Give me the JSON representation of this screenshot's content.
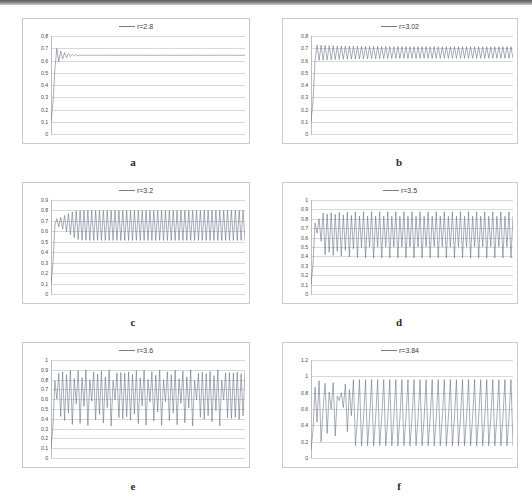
{
  "figure": {
    "accent_color": "#5f6b80",
    "gridline_color": "#d8d8d8",
    "panel_border_color": "#c9c9c9"
  },
  "panels": [
    {
      "caption": "a",
      "legend": "r=2.8",
      "legend_marker": "line-marker",
      "chart_data": {
        "type": "line",
        "title": "r=2.8",
        "xlabel": "",
        "ylabel": "",
        "legend": [
          "r=2.8"
        ],
        "legend_position": "top-center",
        "grid": true,
        "ylim": [
          0,
          0.8
        ],
        "yticks": [
          0,
          0.1,
          0.2,
          0.3,
          0.4,
          0.5,
          0.6,
          0.7,
          0.8
        ],
        "ytick_labels": [
          "0",
          "0.1",
          "0.2",
          "0.3",
          "0.4",
          "0.5",
          "0.6",
          "0.7",
          "0.8"
        ],
        "xlim": [
          0,
          100
        ],
        "r": 2.8,
        "x0": 0.1,
        "behavior": "damped oscillation converging to fixed point 0.643",
        "fixed_point": 0.643
      }
    },
    {
      "caption": "b",
      "legend": "r=3.02",
      "legend_marker": "line-marker",
      "chart_data": {
        "type": "line",
        "title": "r=3.02",
        "xlabel": "",
        "ylabel": "",
        "legend": [
          "r=3.02"
        ],
        "legend_position": "top-center",
        "grid": true,
        "ylim": [
          0,
          0.8
        ],
        "yticks": [
          0,
          0.1,
          0.2,
          0.3,
          0.4,
          0.5,
          0.6,
          0.7,
          0.8
        ],
        "ytick_labels": [
          "0",
          "0.1",
          "0.2",
          "0.3",
          "0.4",
          "0.5",
          "0.6",
          "0.7",
          "0.8"
        ],
        "xlim": [
          0,
          100
        ],
        "r": 3.02,
        "x0": 0.1,
        "behavior": "period-2 cycle between about 0.62 and 0.71",
        "cycle": [
          0.62,
          0.71
        ]
      }
    },
    {
      "caption": "c",
      "legend": "r=3.2",
      "legend_marker": "line-marker",
      "chart_data": {
        "type": "line",
        "title": "r=3.2",
        "xlabel": "",
        "ylabel": "",
        "legend": [
          "r=3.2"
        ],
        "legend_position": "top-center",
        "grid": true,
        "ylim": [
          0,
          0.9
        ],
        "yticks": [
          0,
          0.1,
          0.2,
          0.3,
          0.4,
          0.5,
          0.6,
          0.7,
          0.8,
          0.9
        ],
        "ytick_labels": [
          "0",
          "0.1",
          "0.2",
          "0.3",
          "0.4",
          "0.5",
          "0.6",
          "0.7",
          "0.8",
          "0.9"
        ],
        "xlim": [
          0,
          100
        ],
        "r": 3.2,
        "x0": 0.1,
        "behavior": "period-2 cycle between about 0.513 and 0.799",
        "cycle": [
          0.513,
          0.799
        ]
      }
    },
    {
      "caption": "d",
      "legend": "r=3.5",
      "legend_marker": "line-marker",
      "chart_data": {
        "type": "line",
        "title": "r=3.5",
        "xlabel": "",
        "ylabel": "",
        "legend": [
          "r=3.5"
        ],
        "legend_position": "top-center",
        "grid": true,
        "ylim": [
          0,
          1
        ],
        "yticks": [
          0,
          0.1,
          0.2,
          0.3,
          0.4,
          0.5,
          0.6,
          0.7,
          0.8,
          0.9,
          1
        ],
        "ytick_labels": [
          "0",
          "0.1",
          "0.2",
          "0.3",
          "0.4",
          "0.5",
          "0.6",
          "0.7",
          "0.8",
          "0.9",
          "1"
        ],
        "xlim": [
          0,
          100
        ],
        "r": 3.5,
        "x0": 0.1,
        "behavior": "period-4 cycle with values near 0.383, 0.827, 0.501 and 0.875",
        "cycle": [
          0.383,
          0.827,
          0.501,
          0.875
        ]
      }
    },
    {
      "caption": "e",
      "legend": "r=3.6",
      "legend_marker": "line-marker",
      "chart_data": {
        "type": "line",
        "title": "r=3.6",
        "xlabel": "",
        "ylabel": "",
        "legend": [
          "r=3.6"
        ],
        "legend_position": "top-center",
        "grid": true,
        "ylim": [
          0,
          1
        ],
        "yticks": [
          0,
          0.1,
          0.2,
          0.3,
          0.4,
          0.5,
          0.6,
          0.7,
          0.8,
          0.9,
          1
        ],
        "ytick_labels": [
          "0",
          "0.1",
          "0.2",
          "0.3",
          "0.4",
          "0.5",
          "0.6",
          "0.7",
          "0.8",
          "0.9",
          "1"
        ],
        "xlim": [
          0,
          100
        ],
        "r": 3.6,
        "x0": 0.1,
        "behavior": "chaotic oscillation roughly between 0.32 and 0.90",
        "range": [
          0.32,
          0.9
        ]
      }
    },
    {
      "caption": "f",
      "legend": "r=3.84",
      "legend_marker": "line-marker",
      "chart_data": {
        "type": "line",
        "title": "r=3.84",
        "xlabel": "",
        "ylabel": "",
        "legend": [
          "r=3.84"
        ],
        "legend_position": "top-center",
        "grid": true,
        "ylim": [
          0,
          1.2
        ],
        "yticks": [
          0,
          0.2,
          0.4,
          0.6,
          0.8,
          1,
          1.2
        ],
        "ytick_labels": [
          "0",
          "0.2",
          "0.4",
          "0.6",
          "0.8",
          "1",
          "1.2"
        ],
        "xlim": [
          0,
          100
        ],
        "r": 3.84,
        "x0": 0.1,
        "behavior": "transient chaos settling into period-3 cycle near 0.149, 0.488 and 0.959",
        "cycle": [
          0.149,
          0.488,
          0.959
        ]
      }
    }
  ]
}
